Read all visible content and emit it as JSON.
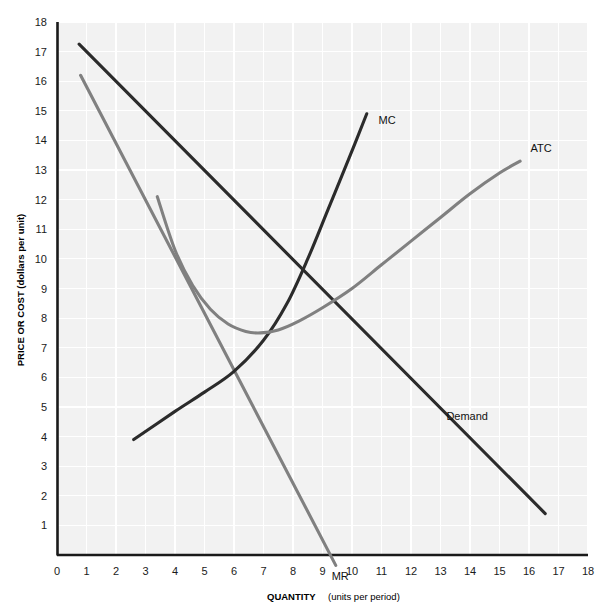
{
  "chart_data": {
    "type": "line",
    "title": "",
    "xlabel": "QUANTITY",
    "xlabel_sub": "(units per period)",
    "ylabel": "PRICE OR COST (dollars per unit)",
    "xlim": [
      0,
      18
    ],
    "ylim": [
      0,
      18
    ],
    "grid": true,
    "legend": "inline-curve-labels",
    "x_ticks": [
      "0",
      "1",
      "2",
      "3",
      "4",
      "5",
      "6",
      "7",
      "8",
      "9",
      "10",
      "11",
      "12",
      "13",
      "14",
      "15",
      "16",
      "17",
      "18"
    ],
    "y_ticks": [
      "1",
      "2",
      "3",
      "4",
      "5",
      "6",
      "7",
      "8",
      "9",
      "10",
      "11",
      "12",
      "13",
      "14",
      "15",
      "16",
      "17",
      "18"
    ],
    "series": [
      {
        "name": "Demand",
        "label": "Demand",
        "color": "#2b2b2b",
        "style": "straight-line",
        "label_x": 13.2,
        "label_y": 4.55,
        "points": [
          [
            0.75,
            17.25
          ],
          [
            16.55,
            1.4
          ]
        ]
      },
      {
        "name": "MR",
        "label": "MR",
        "color": "#808080",
        "style": "straight-line",
        "label_x": 9.6,
        "label_y": -0.85,
        "points": [
          [
            0.8,
            16.2
          ],
          [
            9.45,
            -0.35
          ]
        ]
      },
      {
        "name": "MC",
        "label": "MC",
        "color": "#2b2b2b",
        "style": "upward-sloping-curve",
        "label_x": 10.9,
        "label_y": 14.55,
        "points": [
          [
            2.6,
            3.9
          ],
          [
            4.0,
            4.85
          ],
          [
            5.0,
            5.5
          ],
          [
            6.0,
            6.2
          ],
          [
            7.0,
            7.25
          ],
          [
            7.8,
            8.5
          ],
          [
            8.5,
            10.0
          ],
          [
            9.2,
            11.7
          ],
          [
            9.9,
            13.4
          ],
          [
            10.5,
            14.9
          ]
        ]
      },
      {
        "name": "ATC",
        "label": "ATC",
        "color": "#808080",
        "style": "u-shaped-curve",
        "label_x": 16.05,
        "label_y": 13.6,
        "points": [
          [
            3.4,
            12.1
          ],
          [
            4.0,
            10.3
          ],
          [
            4.6,
            9.1
          ],
          [
            5.2,
            8.3
          ],
          [
            5.8,
            7.8
          ],
          [
            6.4,
            7.55
          ],
          [
            6.9,
            7.5
          ],
          [
            7.5,
            7.6
          ],
          [
            8.2,
            7.9
          ],
          [
            9.0,
            8.35
          ],
          [
            10.0,
            9.0
          ],
          [
            11.0,
            9.8
          ],
          [
            12.0,
            10.6
          ],
          [
            13.0,
            11.4
          ],
          [
            14.0,
            12.2
          ],
          [
            15.0,
            12.9
          ],
          [
            15.7,
            13.3
          ]
        ]
      }
    ],
    "colors": {
      "dark_curve": "#2b2b2b",
      "gray_curve": "#808080",
      "plot_background": "#f2f2f2",
      "grid_line": "#ffffff",
      "axis_line": "#1a1a1a",
      "page_background": "#ffffff"
    }
  }
}
